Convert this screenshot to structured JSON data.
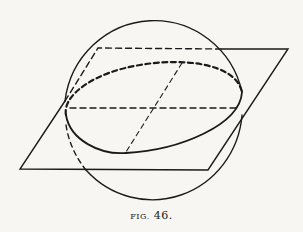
{
  "figure": {
    "caption_prefix": "FIG.",
    "caption_number": "46.",
    "colors": {
      "ink": "#1a1a1a",
      "paper": "#f7f6f2"
    }
  }
}
